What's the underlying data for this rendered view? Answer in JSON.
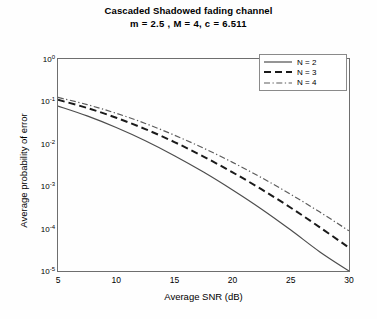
{
  "chart_data": {
    "type": "line",
    "title": "Cascaded Shadowed fading channel",
    "subtitle": "m = 2.5  , M = 4,  c = 6.511",
    "xlabel": "Average SNR (dB)",
    "ylabel": "Average probability of error",
    "xscale": "linear",
    "yscale": "log",
    "xlim": [
      5,
      30
    ],
    "ylim": [
      1e-05,
      1
    ],
    "xticks": [
      5,
      10,
      15,
      20,
      25,
      30
    ],
    "xticklabels": [
      "5",
      "10",
      "15",
      "20",
      "25",
      "30"
    ],
    "yticks": [
      1,
      0.1,
      0.01,
      0.001,
      0.0001,
      1e-05
    ],
    "yticklabels": [
      "10",
      "10",
      "10",
      "10",
      "10",
      "10"
    ],
    "yticklabel_exponents": [
      "0",
      "-1",
      "-2",
      "-3",
      "-4",
      "-5"
    ],
    "grid": false,
    "legend_position": "upper right",
    "x": [
      5,
      7.5,
      10,
      12.5,
      15,
      17.5,
      20,
      22.5,
      25,
      27.5,
      30
    ],
    "series": [
      {
        "name": "N = 2",
        "style": "solid",
        "color": "#4d4d4d",
        "values": [
          0.0775,
          0.0455,
          0.0242,
          0.0118,
          0.00525,
          0.00216,
          0.000815,
          0.000287,
          9.25e-05,
          2.82e-05,
          1e-05
        ]
      },
      {
        "name": "N = 3",
        "style": "dashed",
        "color": "#1a1a1a",
        "values": [
          0.109,
          0.07,
          0.0412,
          0.0222,
          0.011,
          0.005,
          0.00212,
          0.00084,
          0.00031,
          0.000107,
          3.55e-05
        ]
      },
      {
        "name": "N = 4",
        "style": "dashdot",
        "color": "#5c5c5c",
        "values": [
          0.124,
          0.084,
          0.0525,
          0.0302,
          0.016,
          0.0079,
          0.00365,
          0.00158,
          0.00064,
          0.000245,
          8.85e-05
        ]
      }
    ]
  },
  "legend": {
    "entries": [
      {
        "label": "N = 2"
      },
      {
        "label": "N = 3"
      },
      {
        "label": "N = 4"
      }
    ]
  }
}
